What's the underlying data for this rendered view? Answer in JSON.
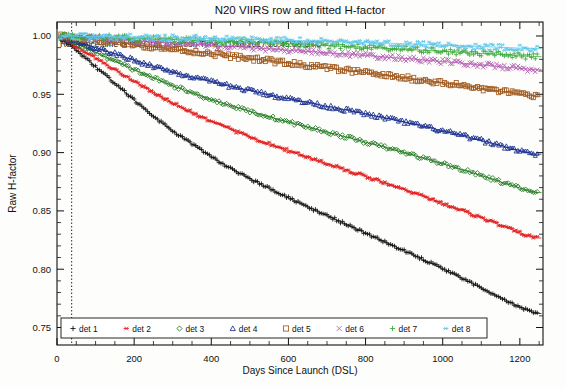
{
  "figure": {
    "title": "N20 VIIRS row and fitted H-factor",
    "annotation": "Reference time is the Orbit Insertion Time: 11/18/2017 10:45:08 UTC"
  },
  "chart_data": {
    "type": "line",
    "title": "N20 VIIRS row and fitted H-factor",
    "subtitle": "Reference time is the Orbit Insertion Time: 11/18/2017 10:45:08 UTC",
    "xlabel": "Days Since Launch (DSL)",
    "ylabel": "Raw H-factor",
    "xlim": [
      0,
      1260
    ],
    "ylim": [
      0.735,
      1.012
    ],
    "xticks": [
      0,
      200,
      400,
      600,
      800,
      1000,
      1200
    ],
    "xtick_labels": [
      "0",
      "200",
      "400",
      "600",
      "800",
      "1000",
      "1200"
    ],
    "yticks": [
      0.75,
      0.8,
      0.85,
      0.9,
      0.95,
      1.0
    ],
    "ytick_labels": [
      "0.75",
      "0.80",
      "0.85",
      "0.90",
      "0.95",
      "1.00"
    ],
    "grid": false,
    "legend_position": "bottom-inside",
    "reference_line_x": 38,
    "x": [
      0,
      40,
      80,
      120,
      160,
      200,
      240,
      280,
      320,
      360,
      400,
      440,
      480,
      520,
      560,
      600,
      640,
      680,
      720,
      760,
      800,
      840,
      880,
      920,
      960,
      1000,
      1040,
      1080,
      1120,
      1160,
      1200,
      1240
    ],
    "series": [
      {
        "name": "det 1",
        "label": "det 1",
        "color": "#111111",
        "marker": "plus",
        "values": [
          1.0,
          0.9905,
          0.9795,
          0.968,
          0.9565,
          0.945,
          0.934,
          0.9235,
          0.914,
          0.905,
          0.8965,
          0.8885,
          0.8812,
          0.8742,
          0.8676,
          0.8612,
          0.855,
          0.849,
          0.843,
          0.837,
          0.831,
          0.825,
          0.819,
          0.8128,
          0.8066,
          0.8002,
          0.7938,
          0.7872,
          0.7806,
          0.774,
          0.7676,
          0.762
        ]
      },
      {
        "name": "det 2",
        "label": "det 2",
        "color": "#e02020",
        "marker": "asterisk",
        "values": [
          1.0,
          0.993,
          0.9852,
          0.9772,
          0.9692,
          0.9612,
          0.9535,
          0.9462,
          0.9394,
          0.933,
          0.927,
          0.9214,
          0.9161,
          0.9111,
          0.9063,
          0.9017,
          0.8972,
          0.8928,
          0.8884,
          0.884,
          0.8796,
          0.8752,
          0.8707,
          0.8661,
          0.8614,
          0.8566,
          0.8517,
          0.8467,
          0.8416,
          0.8364,
          0.8312,
          0.8268
        ]
      },
      {
        "name": "det 3",
        "label": "det 3",
        "color": "#1f7a1f",
        "marker": "diamond",
        "values": [
          1.0,
          0.9948,
          0.989,
          0.983,
          0.977,
          0.9711,
          0.9654,
          0.96,
          0.9549,
          0.9501,
          0.9456,
          0.9413,
          0.9373,
          0.9335,
          0.9298,
          0.9262,
          0.9227,
          0.9193,
          0.9159,
          0.9125,
          0.909,
          0.9055,
          0.9019,
          0.8982,
          0.8944,
          0.8905,
          0.8865,
          0.8824,
          0.8782,
          0.8739,
          0.8695,
          0.8657
        ]
      },
      {
        "name": "det 4",
        "label": "det 4",
        "color": "#1a2f8f",
        "marker": "triangle",
        "values": [
          1.0,
          0.9963,
          0.9922,
          0.9879,
          0.9836,
          0.9793,
          0.9752,
          0.9713,
          0.9676,
          0.9641,
          0.9608,
          0.9577,
          0.9547,
          0.9519,
          0.9491,
          0.9464,
          0.9437,
          0.9411,
          0.9385,
          0.9359,
          0.9332,
          0.9305,
          0.9277,
          0.9248,
          0.9218,
          0.9187,
          0.9155,
          0.9122,
          0.9088,
          0.9053,
          0.9017,
          0.8986
        ]
      },
      {
        "name": "det 5",
        "label": "det 5",
        "color": "#a05a1e",
        "marker": "square",
        "values": [
          1.0,
          0.9987,
          0.9973,
          0.9958,
          0.9943,
          0.9927,
          0.9911,
          0.9895,
          0.9879,
          0.9863,
          0.9847,
          0.9831,
          0.9815,
          0.9799,
          0.9783,
          0.9767,
          0.9751,
          0.9735,
          0.9718,
          0.9702,
          0.9685,
          0.9668,
          0.9651,
          0.9633,
          0.9615,
          0.9597,
          0.9578,
          0.9559,
          0.954,
          0.952,
          0.95,
          0.9484
        ]
      },
      {
        "name": "det 6",
        "label": "det 6",
        "color": "#b25fb2",
        "marker": "x",
        "values": [
          1.0,
          0.9993,
          0.9985,
          0.9977,
          0.9969,
          0.9961,
          0.9953,
          0.9945,
          0.9937,
          0.9929,
          0.9921,
          0.9913,
          0.9905,
          0.9896,
          0.9888,
          0.9879,
          0.987,
          0.9861,
          0.9852,
          0.9843,
          0.9833,
          0.9823,
          0.9813,
          0.9803,
          0.9792,
          0.9781,
          0.977,
          0.9758,
          0.9746,
          0.9734,
          0.9722,
          0.9712
        ]
      },
      {
        "name": "det 7",
        "label": "det 7",
        "color": "#3aa83a",
        "marker": "plus",
        "values": [
          1.0,
          0.9996,
          0.9992,
          0.9988,
          0.9984,
          0.998,
          0.9976,
          0.9972,
          0.9967,
          0.9963,
          0.9958,
          0.9953,
          0.9948,
          0.9943,
          0.9938,
          0.9932,
          0.9927,
          0.9921,
          0.9915,
          0.9909,
          0.9903,
          0.9896,
          0.989,
          0.9883,
          0.9876,
          0.9869,
          0.9861,
          0.9854,
          0.9846,
          0.9838,
          0.983,
          0.9823
        ]
      },
      {
        "name": "det 8",
        "label": "det 8",
        "color": "#5fc8e8",
        "marker": "asterisk",
        "values": [
          1.0,
          0.9998,
          0.9996,
          0.9994,
          0.9992,
          0.999,
          0.9988,
          0.9986,
          0.9983,
          0.9981,
          0.9978,
          0.9975,
          0.9972,
          0.9969,
          0.9966,
          0.9963,
          0.9959,
          0.9956,
          0.9952,
          0.9948,
          0.9944,
          0.994,
          0.9936,
          0.9931,
          0.9927,
          0.9922,
          0.9917,
          0.9912,
          0.9907,
          0.9902,
          0.9896,
          0.9892
        ]
      }
    ]
  },
  "legend": {
    "items": [
      {
        "label": "det 1"
      },
      {
        "label": "det 2"
      },
      {
        "label": "det 3"
      },
      {
        "label": "det 4"
      },
      {
        "label": "det 5"
      },
      {
        "label": "det 6"
      },
      {
        "label": "det 7"
      },
      {
        "label": "det 8"
      }
    ]
  }
}
